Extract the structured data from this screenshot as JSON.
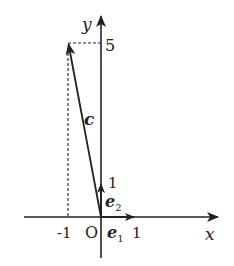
{
  "diagram": {
    "type": "vector-coordinate-plot",
    "axes": {
      "x_label": "x",
      "y_label": "y",
      "origin_label": "O"
    },
    "ticks": {
      "x_neg1": "-1",
      "x_1": "1",
      "y_1": "1",
      "y_5": "5"
    },
    "vectors": [
      {
        "name": "c",
        "label": "c",
        "from": [
          0,
          0
        ],
        "to": [
          -1,
          5
        ]
      },
      {
        "name": "e1",
        "label": "e",
        "subscript": "1",
        "from": [
          0,
          0
        ],
        "to": [
          1,
          0
        ]
      },
      {
        "name": "e2",
        "label": "e",
        "subscript": "2",
        "from": [
          0,
          0
        ],
        "to": [
          0,
          1
        ]
      }
    ],
    "guides": [
      {
        "type": "dashed",
        "from": [
          -1,
          5
        ],
        "to": [
          0,
          5
        ]
      },
      {
        "type": "dashed",
        "from": [
          -1,
          5
        ],
        "to": [
          -1,
          0
        ]
      }
    ],
    "colors": {
      "stroke": "#222222",
      "background": "#ffffff"
    }
  }
}
